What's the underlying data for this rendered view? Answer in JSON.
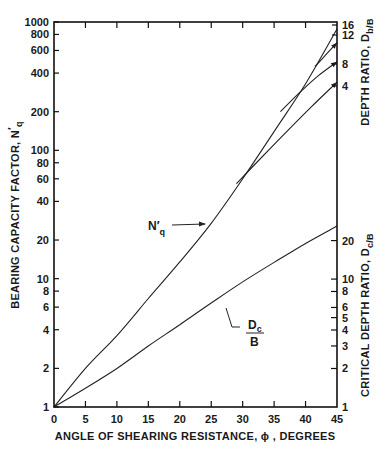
{
  "chart_data": {
    "type": "line",
    "title": "",
    "xlabel": "ANGLE OF SHEARING RESISTANCE, ϕ , DEGREES",
    "ylabel": "BEARING CAPACITY FACTOR, N'q",
    "ylabel_right_top": "DEPTH RATIO, Db/B",
    "ylabel_right_bottom": "CRITICAL DEPTH RATIO, Dc/B",
    "xlim": [
      0,
      45
    ],
    "ylim": [
      1,
      1000
    ],
    "yscale": "log",
    "grid": false,
    "x_ticks": [
      0,
      5,
      10,
      15,
      20,
      25,
      30,
      35,
      40,
      45
    ],
    "y_ticks": [
      1,
      2,
      4,
      6,
      8,
      10,
      20,
      40,
      60,
      80,
      100,
      200,
      400,
      600,
      800,
      1000
    ],
    "right_top_ticks": [
      {
        "label": "16",
        "value": 880
      },
      {
        "label": "12",
        "value": 690
      },
      {
        "label": "8",
        "value": 490
      },
      {
        "label": "4",
        "value": 340
      }
    ],
    "right_bottom_ticks": [
      {
        "label": "20",
        "value": 20
      },
      {
        "label": "10",
        "value": 10
      },
      {
        "label": "8",
        "value": 8
      },
      {
        "label": "6",
        "value": 6
      },
      {
        "label": "5",
        "value": 5
      },
      {
        "label": "4",
        "value": 4
      },
      {
        "label": "3",
        "value": 3
      },
      {
        "label": "2",
        "value": 2
      },
      {
        "label": "1",
        "value": 1
      }
    ],
    "series": [
      {
        "name": "N'q (Db/B = 16)",
        "x": [
          0,
          5,
          10,
          15,
          20,
          25,
          30,
          35,
          40,
          45
        ],
        "values": [
          1,
          2.0,
          3.6,
          7,
          13.5,
          27,
          60,
          140,
          330,
          880
        ]
      },
      {
        "name": "Db/B = 4",
        "x": [
          29,
          33,
          37,
          41,
          45
        ],
        "values": [
          55,
          88,
          140,
          220,
          340
        ]
      },
      {
        "name": "Db/B = 8",
        "x": [
          36,
          39,
          42,
          45
        ],
        "values": [
          200,
          280,
          380,
          490
        ]
      },
      {
        "name": "Db/B = 12",
        "x": [
          41.5,
          43,
          45
        ],
        "values": [
          450,
          540,
          690
        ]
      },
      {
        "name": "Dc/B",
        "x": [
          0,
          5,
          10,
          15,
          20,
          25,
          30,
          35,
          40,
          45
        ],
        "values": [
          1,
          1.4,
          2.0,
          3.0,
          4.4,
          6.5,
          9.5,
          13.5,
          19,
          26
        ]
      }
    ],
    "annotations": [
      {
        "text": "N'q",
        "x": 16,
        "y": 27
      },
      {
        "text": "Dc/B",
        "x": 30,
        "y": 4.5
      }
    ]
  },
  "labels": {
    "x_axis_title": "ANGLE OF SHEARING RESISTANCE, ϕ , DEGREES",
    "y_axis_title_main": "BEARING CAPACITY FACTOR, N",
    "y_axis_title_sub": "q",
    "right_top_title_main": "DEPTH RATIO, D",
    "right_top_title_sub": "b/B",
    "right_bottom_title_main": "CRITICAL DEPTH RATIO, D",
    "right_bottom_title_sub": "c/B",
    "nq_label": "N′",
    "nq_sub": "q",
    "dc_num": "D",
    "dc_num_sub": "c",
    "dc_den": "B"
  }
}
